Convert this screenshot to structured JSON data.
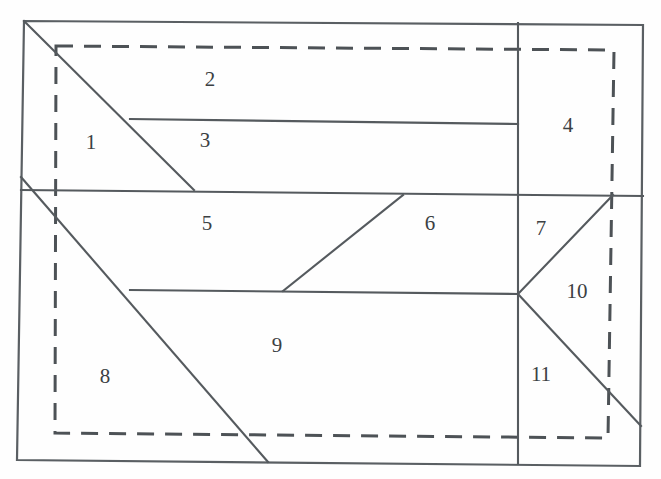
{
  "figure": {
    "title": "",
    "canvas": {
      "width": 661,
      "height": 479,
      "background": "#fefefe"
    },
    "colors": {
      "solid_stroke": "#555a5e",
      "dashed_stroke": "#4d5256",
      "label_text": "#3b4043",
      "background": "#fefefe"
    },
    "outer_boundary": {
      "name": "outer-quadrilateral",
      "style": "solid",
      "points": "24,21 643,25 640,466 17,460"
    },
    "dashed_boundary": {
      "name": "inner-dashed-rectangle",
      "style": "dashed",
      "points": "56,46 614,50 608,438 55,433"
    },
    "solid_segments": [
      {
        "name": "region1-diagonal",
        "x1": 24,
        "y1": 21,
        "x2": 194,
        "y2": 190
      },
      {
        "name": "region3-top-line",
        "x1": 130,
        "y1": 119,
        "x2": 518,
        "y2": 124
      },
      {
        "name": "mid-horizontal-line",
        "x1": 21,
        "y1": 190,
        "x2": 643,
        "y2": 196
      },
      {
        "name": "long-diagonal-8-9",
        "x1": 21,
        "y1": 177,
        "x2": 268,
        "y2": 462
      },
      {
        "name": "region6-diagonal",
        "x1": 283,
        "y1": 291,
        "x2": 403,
        "y2": 195
      },
      {
        "name": "region9-top-line",
        "x1": 130,
        "y1": 290,
        "x2": 518,
        "y2": 294
      },
      {
        "name": "right-vertical-line",
        "x1": 518,
        "y1": 23,
        "x2": 518,
        "y2": 464
      },
      {
        "name": "region10-upper-diagonal",
        "x1": 518,
        "y1": 294,
        "x2": 613,
        "y2": 195
      },
      {
        "name": "region11-lower-diagonal",
        "x1": 518,
        "y1": 294,
        "x2": 641,
        "y2": 426
      }
    ],
    "region_labels": [
      {
        "name": "region-label-1",
        "text": "1",
        "x": 91,
        "y": 144
      },
      {
        "name": "region-label-2",
        "text": "2",
        "x": 210,
        "y": 81
      },
      {
        "name": "region-label-3",
        "text": "3",
        "x": 205,
        "y": 142
      },
      {
        "name": "region-label-4",
        "text": "4",
        "x": 568,
        "y": 127
      },
      {
        "name": "region-label-5",
        "text": "5",
        "x": 207,
        "y": 225
      },
      {
        "name": "region-label-6",
        "text": "6",
        "x": 430,
        "y": 225
      },
      {
        "name": "region-label-7",
        "text": "7",
        "x": 541,
        "y": 230
      },
      {
        "name": "region-label-8",
        "text": "8",
        "x": 105,
        "y": 378
      },
      {
        "name": "region-label-9",
        "text": "9",
        "x": 277,
        "y": 347
      },
      {
        "name": "region-label-10",
        "text": "10",
        "x": 577,
        "y": 293
      },
      {
        "name": "region-label-11",
        "text": "11",
        "x": 541,
        "y": 376
      }
    ]
  }
}
